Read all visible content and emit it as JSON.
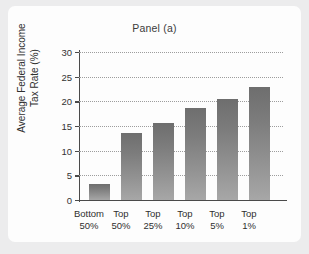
{
  "chart_data": {
    "type": "bar",
    "title": "Panel (a)",
    "xlabel": "",
    "ylabel": "Average Federal Income Tax Rate (%)",
    "ylabel_line1": "Average Federal Income",
    "ylabel_line2": "Tax Rate (%)",
    "categories": [
      "Bottom 50%",
      "Top 50%",
      "Top 25%",
      "Top 10%",
      "Top 5%",
      "Top 1%"
    ],
    "category_lines": [
      {
        "line1": "Bottom",
        "line2": "50%"
      },
      {
        "line1": "Top",
        "line2": "50%"
      },
      {
        "line1": "Top",
        "line2": "25%"
      },
      {
        "line1": "Top",
        "line2": "10%"
      },
      {
        "line1": "Top",
        "line2": "5%"
      },
      {
        "line1": "Top",
        "line2": "1%"
      }
    ],
    "values": [
      3.3,
      13.6,
      15.7,
      18.6,
      20.5,
      23.0
    ],
    "ylim": [
      0,
      30
    ],
    "yticks": [
      0,
      5,
      10,
      15,
      20,
      25,
      30
    ],
    "ytick_labels": [
      "0",
      "5",
      "10",
      "15",
      "20",
      "25",
      "30"
    ],
    "grid": true,
    "grid_style": "dotted",
    "legend": "none",
    "bar_color_top": "#6e6e6e",
    "bar_color_bottom": "#a7a7a7",
    "axis_color": "#4a4a4a",
    "grid_color": "#9d9d9d",
    "panel_background": "#fdfdfd",
    "page_background": "#ececed"
  }
}
